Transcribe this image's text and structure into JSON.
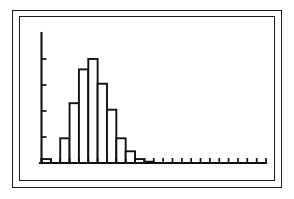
{
  "figure": {
    "kind": "scanned-histogram-figure",
    "background_color": "#ffffff",
    "ink_color": "#111111",
    "frame": {
      "style": "double-rectangle-border",
      "outer_label": "outer-border",
      "inner_label": "inner-border"
    }
  },
  "chart_data": {
    "type": "bar",
    "title": "",
    "subtitle": "",
    "xlabel": "",
    "ylabel": "",
    "grid": false,
    "legend": null,
    "legend_position": "none",
    "bar_style": "histogram-adjacent-unfilled",
    "categories": [
      "1",
      "2",
      "3",
      "4",
      "5",
      "6",
      "7",
      "8",
      "9",
      "10",
      "11",
      "12",
      "13",
      "14",
      "15",
      "16",
      "17",
      "18",
      "19",
      "20",
      "21",
      "22",
      "23",
      "24"
    ],
    "values": [
      3,
      0,
      19,
      46,
      72,
      80,
      61,
      41,
      19,
      9,
      3,
      1,
      0,
      0,
      0,
      0,
      0,
      0,
      0,
      0,
      0,
      0,
      0,
      0
    ],
    "xlim": [
      0,
      24
    ],
    "ylim": [
      0,
      100
    ],
    "x_tick_count": 24,
    "y_tick_count": 4,
    "y_tick_values": [
      20,
      40,
      60,
      80
    ],
    "x_tick_labels": [],
    "y_tick_labels": [],
    "annotations": [],
    "shape_description": "right-skewed unimodal distribution peaking at the sixth bin with a long flat tail to the right"
  },
  "accessibility": {
    "chart_role": "histogram",
    "axis_x_name": "x-axis",
    "axis_y_name": "y-axis"
  }
}
